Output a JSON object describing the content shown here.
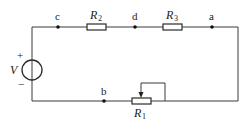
{
  "diagram": {
    "type": "circuit",
    "source": {
      "label": "V",
      "plus": "+",
      "minus": "−"
    },
    "nodes": [
      {
        "id": "c",
        "label": "c"
      },
      {
        "id": "d",
        "label": "d"
      },
      {
        "id": "a",
        "label": "a"
      },
      {
        "id": "b",
        "label": "b"
      }
    ],
    "resistors": [
      {
        "id": "R2",
        "letter": "R",
        "sub": "2"
      },
      {
        "id": "R3",
        "letter": "R",
        "sub": "3"
      },
      {
        "id": "R1",
        "letter": "R",
        "sub": "1",
        "variable": true
      }
    ],
    "colors": {
      "wire": "#3a3a3a",
      "node": "#111111"
    }
  }
}
